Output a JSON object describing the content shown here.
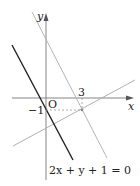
{
  "diagram": {
    "axes": {
      "x_label": "x",
      "y_label": "y",
      "origin_label": "O"
    },
    "tick_labels": {
      "x_tick": "3",
      "y_tick": "−1"
    },
    "point": {
      "x": 3,
      "y": -1
    },
    "lines": [
      {
        "name": "given-line",
        "equation": "2x + y + 1 = 0",
        "color": "#222222"
      },
      {
        "name": "parallel-line",
        "equation": "y = -2x + 5",
        "color": "#aaaaaa"
      },
      {
        "name": "perpendicular-line",
        "equation": "y = x/2 - 5/2",
        "color": "#aaaaaa"
      }
    ],
    "equation_label": "2x + y + 1 = 0"
  }
}
